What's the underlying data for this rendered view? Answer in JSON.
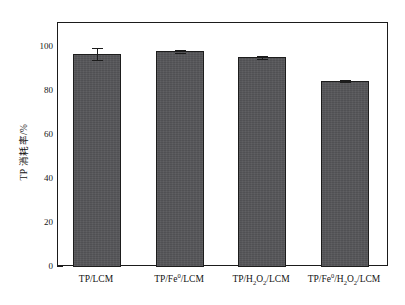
{
  "chart_data": {
    "type": "bar",
    "title": "",
    "xlabel": "",
    "ylabel": "TP 消耗率/%",
    "categories": [
      "TP/LCM",
      "TP/Fe0/LCM",
      "TP/H2O2/LCM",
      "TP/Fe0/H2O2/LCM"
    ],
    "values": [
      96.8,
      98.0,
      95.4,
      84.5
    ],
    "errors": [
      2.8,
      0.5,
      0.7,
      0.4
    ],
    "ylim": [
      0,
      110
    ],
    "y_ticks_major": [
      0,
      20,
      40,
      60,
      80,
      100
    ],
    "y_tick_labels": [
      "0",
      "20",
      "40",
      "60",
      "80",
      "100"
    ],
    "y_ticks_minor": [
      10,
      30,
      50,
      70,
      90
    ],
    "grid": false,
    "legend": false,
    "bar_color": "#555558",
    "bar_edge_color": "#1d1d1d",
    "axis_color": "#1b1b1b"
  },
  "axes": {
    "y_title": "TP 消耗率/%",
    "tick_labels": {
      "t0": "0",
      "t20": "20",
      "t40": "40",
      "t60": "60",
      "t80": "80",
      "t100": "100"
    }
  },
  "categories": [
    {
      "prefix": "TP/LCM",
      "sup1": "",
      "mid": "",
      "sub1": "",
      "sup2": "",
      "suffix": ""
    },
    {
      "prefix": "TP/Fe",
      "sup1": "0",
      "mid": "/LCM"
    },
    {
      "prefix": "TP/H",
      "sub1": "2",
      "mid": "O",
      "sub2": "2",
      "suffix": "/LCM"
    },
    {
      "prefix": "TP/Fe",
      "sup1": "0",
      "mid": "/H",
      "sub1": "2",
      "mid2": "O",
      "sub2": "2",
      "suffix": "/LCM"
    }
  ]
}
